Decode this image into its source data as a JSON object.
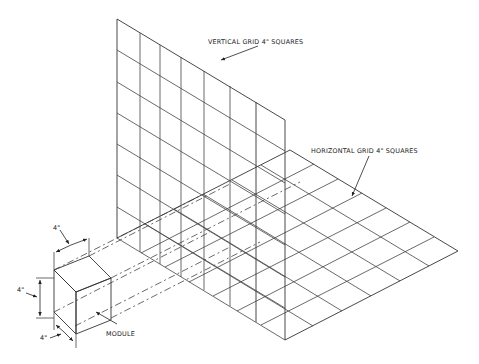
{
  "diagram": {
    "type": "isometric modular coordination drawing",
    "labels": {
      "vertical_grid": "VERTICAL GRID  4\" SQUARES",
      "horizontal_grid": "HORIZONTAL GRID 4\" SQUARES",
      "module": "MODULE",
      "dim_top": "4\"",
      "dim_left": "4\"",
      "dim_bottom": "4\""
    },
    "vertical_grid": {
      "columns": 6,
      "rows": 7,
      "square_size": "4\""
    },
    "horizontal_grid": {
      "square_size": "4\""
    },
    "module": {
      "width": "4\"",
      "height": "4\"",
      "depth": "4\""
    },
    "colors": {
      "line": "#333333",
      "background": "#ffffff"
    }
  }
}
